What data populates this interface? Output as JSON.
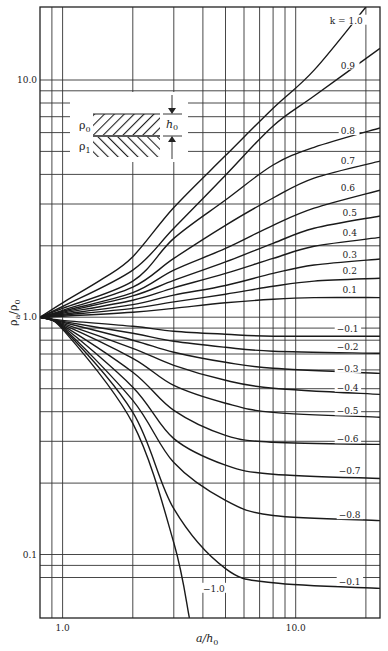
{
  "chart_data": {
    "type": "line",
    "title": "",
    "xlabel": "a/h0",
    "ylabel": "ρa/ρ0",
    "xscale": "log",
    "yscale": "log",
    "xlim": [
      0.8,
      23
    ],
    "ylim": [
      0.054,
      20.3
    ],
    "grid": true,
    "x_ticks": [
      {
        "value": 1.0,
        "label": "1.0"
      },
      {
        "value": 10.0,
        "label": "10.0"
      }
    ],
    "y_ticks": [
      {
        "value": 10.0,
        "label": "10.0"
      },
      {
        "value": 1.0,
        "label": "1.0"
      },
      {
        "value": 0.1,
        "label": "0.1"
      }
    ],
    "x_gridlines": [
      0.9,
      1,
      2,
      3,
      4,
      5,
      6,
      7,
      8,
      9,
      10,
      20
    ],
    "y_gridlines": [
      0.08,
      0.09,
      0.1,
      0.2,
      0.3,
      0.4,
      0.5,
      0.6,
      0.7,
      0.8,
      0.9,
      1,
      2,
      3,
      4,
      5,
      6,
      7,
      8,
      9,
      10
    ],
    "legend": "curves labeled inline by k",
    "series": [
      {
        "name": "k = 1.0",
        "label": "k = 1.0",
        "label_pos": [
          14.0,
          17.6
        ],
        "points": [
          [
            0.8,
            1.0
          ],
          [
            1,
            1.15
          ],
          [
            1.5,
            1.46
          ],
          [
            2,
            1.8
          ],
          [
            3,
            2.9
          ],
          [
            5,
            4.8
          ],
          [
            8,
            7.6
          ],
          [
            12,
            11.0
          ],
          [
            20,
            20.3
          ]
        ]
      },
      {
        "name": "k = 0.9",
        "label": "0.9",
        "label_pos": [
          15.6,
          11.4
        ],
        "points": [
          [
            0.8,
            1.0
          ],
          [
            1,
            1.11
          ],
          [
            2,
            1.58
          ],
          [
            3,
            2.37
          ],
          [
            5,
            3.97
          ],
          [
            8,
            6.4
          ],
          [
            12,
            8.56
          ],
          [
            23,
            13.6
          ]
        ]
      },
      {
        "name": "k = 0.8",
        "label": "0.8",
        "label_pos": [
          15.6,
          6.03
        ],
        "points": [
          [
            0.8,
            1.0
          ],
          [
            1,
            1.09
          ],
          [
            2,
            1.42
          ],
          [
            3,
            2.15
          ],
          [
            5,
            3.12
          ],
          [
            8,
            4.38
          ],
          [
            12,
            5.2
          ],
          [
            23,
            6.28
          ]
        ]
      },
      {
        "name": "k = 0.7",
        "label": "0.7",
        "label_pos": [
          15.6,
          4.5
        ],
        "points": [
          [
            0.8,
            1.0
          ],
          [
            1,
            1.07
          ],
          [
            2,
            1.34
          ],
          [
            3,
            1.77
          ],
          [
            5,
            2.44
          ],
          [
            8,
            3.18
          ],
          [
            12,
            3.86
          ],
          [
            23,
            4.55
          ]
        ]
      },
      {
        "name": "k = 0.6",
        "label": "0.6",
        "label_pos": [
          15.6,
          3.47
        ],
        "points": [
          [
            0.8,
            1.0
          ],
          [
            1,
            1.06
          ],
          [
            2,
            1.27
          ],
          [
            3,
            1.58
          ],
          [
            5,
            1.95
          ],
          [
            8,
            2.44
          ],
          [
            12,
            2.88
          ],
          [
            23,
            3.43
          ]
        ]
      },
      {
        "name": "k = 0.5",
        "label": "0.5",
        "label_pos": [
          15.9,
          2.72
        ],
        "points": [
          [
            0.8,
            1.0
          ],
          [
            1,
            1.05
          ],
          [
            2,
            1.23
          ],
          [
            3,
            1.43
          ],
          [
            5,
            1.71
          ],
          [
            8,
            2.05
          ],
          [
            12,
            2.37
          ],
          [
            23,
            2.67
          ]
        ]
      },
      {
        "name": "k = 0.4",
        "label": "0.4",
        "label_pos": [
          15.9,
          2.24
        ],
        "points": [
          [
            0.8,
            1.0
          ],
          [
            1,
            1.04
          ],
          [
            2,
            1.18
          ],
          [
            3,
            1.33
          ],
          [
            5,
            1.53
          ],
          [
            8,
            1.77
          ],
          [
            12,
            1.99
          ],
          [
            23,
            2.17
          ]
        ]
      },
      {
        "name": "k = 0.3",
        "label": "0.3",
        "label_pos": [
          15.9,
          1.81
        ],
        "points": [
          [
            0.8,
            1.0
          ],
          [
            1,
            1.03
          ],
          [
            2,
            1.13
          ],
          [
            3,
            1.24
          ],
          [
            5,
            1.36
          ],
          [
            8,
            1.53
          ],
          [
            12,
            1.66
          ],
          [
            23,
            1.76
          ]
        ]
      },
      {
        "name": "k = 0.2",
        "label": "0.2",
        "label_pos": [
          15.9,
          1.55
        ],
        "points": [
          [
            0.8,
            1.0
          ],
          [
            1,
            1.02
          ],
          [
            2,
            1.09
          ],
          [
            3,
            1.16
          ],
          [
            5,
            1.25
          ],
          [
            8,
            1.35
          ],
          [
            12,
            1.42
          ],
          [
            23,
            1.46
          ]
        ]
      },
      {
        "name": "k = 0.1",
        "label": "0.1",
        "label_pos": [
          15.9,
          1.29
        ],
        "points": [
          [
            0.8,
            1.0
          ],
          [
            1,
            1.01
          ],
          [
            2,
            1.05
          ],
          [
            3,
            1.09
          ],
          [
            5,
            1.15
          ],
          [
            8,
            1.19
          ],
          [
            12,
            1.21
          ],
          [
            23,
            1.21
          ]
        ]
      },
      {
        "name": "k = -0.1",
        "label": "−0.1",
        "label_pos": [
          15.0,
          0.88
        ],
        "points": [
          [
            0.8,
            1.0
          ],
          [
            1,
            0.97
          ],
          [
            2,
            0.916
          ],
          [
            3,
            0.873
          ],
          [
            5,
            0.848
          ],
          [
            8,
            0.832
          ],
          [
            23,
            0.832
          ]
        ]
      },
      {
        "name": "k = -0.2",
        "label": "−0.2",
        "label_pos": [
          15.0,
          0.74
        ],
        "points": [
          [
            0.8,
            1.0
          ],
          [
            1,
            0.96
          ],
          [
            2,
            0.856
          ],
          [
            3,
            0.792
          ],
          [
            5,
            0.747
          ],
          [
            8,
            0.719
          ],
          [
            23,
            0.705
          ]
        ]
      },
      {
        "name": "k = -0.3",
        "label": "−0.3",
        "label_pos": [
          15.0,
          0.6
        ],
        "points": [
          [
            0.8,
            1.0
          ],
          [
            1,
            0.952
          ],
          [
            2,
            0.8
          ],
          [
            3,
            0.712
          ],
          [
            5,
            0.646
          ],
          [
            8,
            0.609
          ],
          [
            23,
            0.58
          ]
        ]
      },
      {
        "name": "k = -0.4",
        "label": "−0.4",
        "label_pos": [
          15.0,
          0.5
        ],
        "points": [
          [
            0.8,
            1.0
          ],
          [
            1,
            0.943
          ],
          [
            2,
            0.74
          ],
          [
            3,
            0.627
          ],
          [
            5,
            0.542
          ],
          [
            8,
            0.502
          ],
          [
            23,
            0.473
          ]
        ]
      },
      {
        "name": "k = -0.5",
        "label": "−0.5",
        "label_pos": [
          15.0,
          0.397
        ],
        "points": [
          [
            0.8,
            1.0
          ],
          [
            1,
            0.934
          ],
          [
            2,
            0.671
          ],
          [
            3,
            0.516
          ],
          [
            5,
            0.434
          ],
          [
            8,
            0.397
          ],
          [
            23,
            0.379
          ]
        ]
      },
      {
        "name": "k = -0.6",
        "label": "−0.6",
        "label_pos": [
          15.0,
          0.303
        ],
        "points": [
          [
            0.8,
            1.0
          ],
          [
            1,
            0.925
          ],
          [
            2,
            0.586
          ],
          [
            3,
            0.405
          ],
          [
            5,
            0.318
          ],
          [
            8,
            0.297
          ],
          [
            23,
            0.291
          ]
        ]
      },
      {
        "name": "k = -0.7",
        "label": "−0.7",
        "label_pos": [
          15.3,
          0.222
        ],
        "points": [
          [
            0.8,
            1.0
          ],
          [
            1,
            0.916
          ],
          [
            2,
            0.507
          ],
          [
            3,
            0.308
          ],
          [
            5,
            0.238
          ],
          [
            8,
            0.218
          ],
          [
            23,
            0.209
          ]
        ]
      },
      {
        "name": "k = -0.8",
        "label": "−0.8",
        "label_pos": [
          15.3,
          0.145
        ],
        "points": [
          [
            0.8,
            1.0
          ],
          [
            1,
            0.907
          ],
          [
            2,
            0.446
          ],
          [
            3,
            0.244
          ],
          [
            5,
            0.169
          ],
          [
            8,
            0.146
          ],
          [
            23,
            0.139
          ]
        ]
      },
      {
        "name": "k = -0.9",
        "label": "−0.1",
        "label_pos": [
          15.3,
          0.076
        ],
        "points": [
          [
            0.8,
            1.0
          ],
          [
            1,
            0.9
          ],
          [
            2,
            0.397
          ],
          [
            3,
            0.156
          ],
          [
            5,
            0.0872
          ],
          [
            8,
            0.076
          ],
          [
            23,
            0.072
          ]
        ]
      },
      {
        "name": "k = -1.0",
        "label": "−1.0",
        "label_pos": [
          4.0,
          0.071
        ],
        "points": [
          [
            0.8,
            1.0
          ],
          [
            1,
            0.89
          ],
          [
            2,
            0.357
          ],
          [
            3,
            0.112
          ],
          [
            3.5,
            0.054
          ]
        ]
      }
    ]
  },
  "inset": {
    "upper_layer_label": "ρ",
    "upper_layer_sub": "0",
    "lower_layer_label": "ρ",
    "lower_layer_sub": "1",
    "thickness_label": "h",
    "thickness_sub": "0"
  },
  "axes": {
    "x_title_main": "a/h",
    "x_title_sub": "0",
    "y_title_main": "ρ",
    "y_title_sub_a": "a",
    "y_title_mid": "/ρ",
    "y_title_sub_b": "0"
  }
}
